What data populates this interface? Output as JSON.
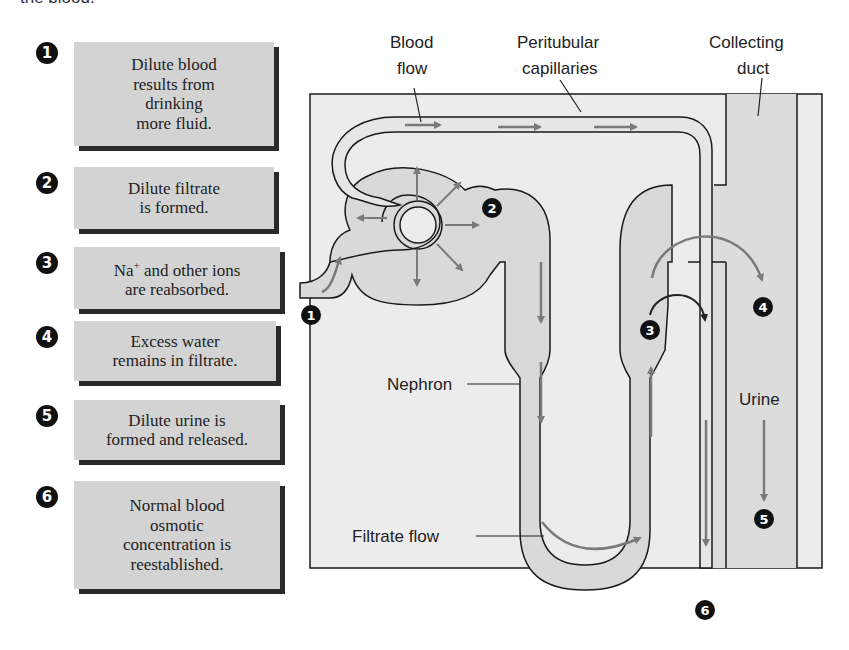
{
  "caption_fragment": "the blood.",
  "steps": [
    {
      "number": "1",
      "text": "Dilute blood\nresults from\ndrinking\nmore fluid."
    },
    {
      "number": "2",
      "text": "Dilute filtrate\nis formed."
    },
    {
      "number": "3",
      "text_prefix": "Na",
      "text_sup": "+",
      "text_rest": " and other ions\nare reabsorbed."
    },
    {
      "number": "4",
      "text": "Excess water\nremains in filtrate."
    },
    {
      "number": "5",
      "text": "Dilute urine is\nformed and released."
    },
    {
      "number": "6",
      "text": "Normal blood\nosmotic\nconcentration is\nreestablished."
    }
  ],
  "diagram": {
    "labels": {
      "blood_flow_1": "Blood",
      "blood_flow_2": "flow",
      "peritubular_1": "Peritubular",
      "peritubular_2": "capillaries",
      "collecting_1": "Collecting",
      "collecting_2": "duct",
      "nephron": "Nephron",
      "filtrate_flow": "Filtrate flow",
      "urine": "Urine"
    },
    "markers": [
      "1",
      "2",
      "3",
      "4",
      "5",
      "6"
    ],
    "colors": {
      "background_panel": "#ececec",
      "nephron_fill": "#d9d9d9",
      "capillary_fill": "#e6e6e6",
      "duct_fill": "#dcdcdc",
      "arrow": "#7a7a7a",
      "outline": "#1a1a1a",
      "callout_box": "#d3d3d3",
      "callout_shadow": "#2a2a2a"
    }
  }
}
